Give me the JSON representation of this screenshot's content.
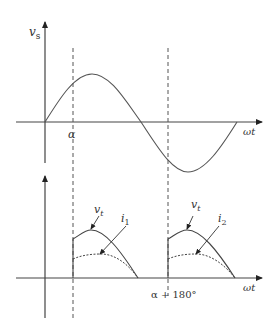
{
  "top_plot": {
    "y_label": "v",
    "y_label_sub": "s",
    "x_label": "ωt",
    "alpha_label": "α"
  },
  "bottom_plot": {
    "x_label": "ωt",
    "alpha180_label": "α + 180°",
    "pulse1": {
      "voltage_label": "v",
      "voltage_sub": "t",
      "current_label": "i",
      "current_sub": "1"
    },
    "pulse2": {
      "voltage_label": "v",
      "voltage_sub": "t",
      "current_label": "i",
      "current_sub": "2"
    }
  },
  "colors": {
    "line": "#333333"
  }
}
